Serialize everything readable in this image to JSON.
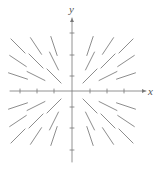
{
  "figure": {
    "kind": "slope-field",
    "width": 161,
    "height": 169,
    "background": "#ffffff",
    "stroke_color": "#808080",
    "axis_color": "#777777",
    "label_color": "#555555"
  },
  "axes": {
    "x_label": "x",
    "y_label": "y",
    "origin_px": [
      72,
      91
    ],
    "x_axis": {
      "x_start_px": 10,
      "x_end_px": 146,
      "y_px": 91,
      "arrow": "right"
    },
    "y_axis": {
      "y_start_px": 162,
      "y_end_px": 18,
      "x_px": 72,
      "arrow": "up"
    },
    "x_ticks_px": [
      20,
      37,
      54,
      90,
      107,
      124
    ],
    "y_ticks_px": [
      33,
      55,
      76,
      107,
      128,
      150
    ],
    "tick_half_len_px": 2
  },
  "chart_data": {
    "type": "scatter",
    "title": "",
    "xlabel": "x",
    "ylabel": "y",
    "grid": false,
    "legend": null,
    "xlim": [
      -3.5,
      3.5
    ],
    "ylim": [
      -3.5,
      3.5
    ],
    "x": [
      -3,
      -2,
      -1,
      1,
      2,
      3
    ],
    "y": [
      3,
      2,
      1,
      -1,
      -2,
      -3
    ],
    "segment_length_px": 20,
    "segments": [
      {
        "x": -3,
        "y": 3,
        "slope": -1.0
      },
      {
        "x": -2,
        "y": 3,
        "slope": -1.5
      },
      {
        "x": -1,
        "y": 3,
        "slope": -3.0
      },
      {
        "x": 1,
        "y": 3,
        "slope": 3.0
      },
      {
        "x": 2,
        "y": 3,
        "slope": 1.5
      },
      {
        "x": 3,
        "y": 3,
        "slope": 1.0
      },
      {
        "x": -3,
        "y": 2,
        "slope": -0.667
      },
      {
        "x": -2,
        "y": 2,
        "slope": -1.0
      },
      {
        "x": -1,
        "y": 2,
        "slope": -2.0
      },
      {
        "x": 1,
        "y": 2,
        "slope": 2.0
      },
      {
        "x": 2,
        "y": 2,
        "slope": 1.0
      },
      {
        "x": 3,
        "y": 2,
        "slope": 0.667
      },
      {
        "x": -3,
        "y": 1,
        "slope": -0.333
      },
      {
        "x": -2,
        "y": 1,
        "slope": -0.5
      },
      {
        "x": -1,
        "y": 1,
        "slope": -1.0
      },
      {
        "x": 1,
        "y": 1,
        "slope": 1.0
      },
      {
        "x": 2,
        "y": 1,
        "slope": 0.5
      },
      {
        "x": 3,
        "y": 1,
        "slope": 0.333
      },
      {
        "x": -3,
        "y": -1,
        "slope": 0.333
      },
      {
        "x": -2,
        "y": -1,
        "slope": 0.5
      },
      {
        "x": -1,
        "y": -1,
        "slope": 1.0
      },
      {
        "x": 1,
        "y": -1,
        "slope": -1.0
      },
      {
        "x": 2,
        "y": -1,
        "slope": -0.5
      },
      {
        "x": 3,
        "y": -1,
        "slope": -0.333
      },
      {
        "x": -3,
        "y": -2,
        "slope": 0.667
      },
      {
        "x": -2,
        "y": -2,
        "slope": 1.0
      },
      {
        "x": -1,
        "y": -2,
        "slope": 2.0
      },
      {
        "x": 1,
        "y": -2,
        "slope": -2.0
      },
      {
        "x": 2,
        "y": -2,
        "slope": -1.0
      },
      {
        "x": 3,
        "y": -2,
        "slope": -0.667
      },
      {
        "x": -3,
        "y": -3,
        "slope": 1.0
      },
      {
        "x": -2,
        "y": -3,
        "slope": 1.5
      },
      {
        "x": -1,
        "y": -3,
        "slope": 3.0
      },
      {
        "x": 1,
        "y": -3,
        "slope": -3.0
      },
      {
        "x": 2,
        "y": -3,
        "slope": -1.5
      },
      {
        "x": 3,
        "y": -3,
        "slope": -1.0
      }
    ]
  }
}
